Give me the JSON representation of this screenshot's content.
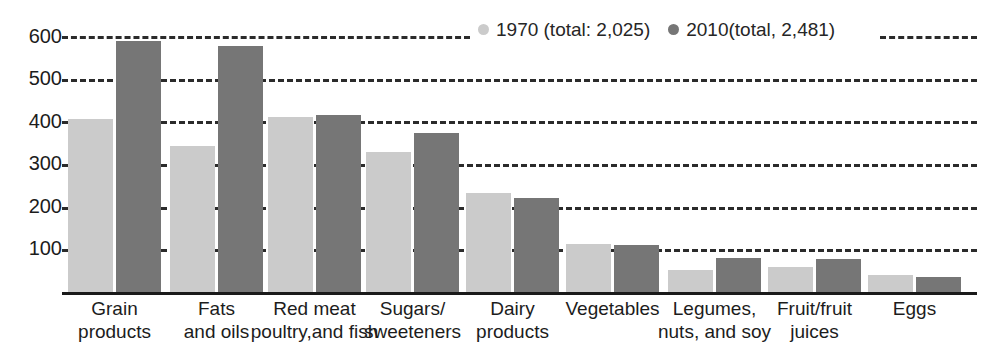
{
  "chart_data": {
    "type": "bar",
    "title": "",
    "subtitle": "",
    "xlabel": "",
    "ylabel": "",
    "ylim": [
      0,
      640
    ],
    "yticks": [
      100,
      200,
      300,
      400,
      500,
      600
    ],
    "ytick_labels": [
      "100",
      "200",
      "300",
      "400",
      "500",
      "600"
    ],
    "grid": true,
    "grid_style": "dashed-horizontal",
    "legend_position": "top-center",
    "categories": [
      "Grain products",
      "Fats and oils",
      "Red meat poultry,and fish",
      "Sugars/ sweeteners",
      "Dairy products",
      "Vegetables",
      "Legumes, nuts, and soy",
      "Fruit/fruit juices",
      "Eggs"
    ],
    "category_lines": [
      [
        "Grain",
        "products"
      ],
      [
        "Fats",
        "and oils"
      ],
      [
        "Red meat",
        "poultry,and fish"
      ],
      [
        "Sugars/",
        "sweeteners"
      ],
      [
        "Dairy",
        "products"
      ],
      [
        "Vegetables"
      ],
      [
        "Legumes,",
        "nuts, and soy"
      ],
      [
        "Fruit/fruit",
        "juices"
      ],
      [
        "Eggs"
      ]
    ],
    "series": [
      {
        "name": "1970 (total: 2,025)",
        "color": "#cbcbcb",
        "values": [
          408,
          345,
          412,
          330,
          235,
          115,
          55,
          60,
          42
        ]
      },
      {
        "name": "2010(total, 2,481)",
        "color": "#767676",
        "values": [
          590,
          578,
          418,
          375,
          222,
          113,
          82,
          80,
          37
        ]
      }
    ]
  },
  "legend": {
    "items": [
      {
        "label": "1970 (total: 2,025)",
        "color": "#cbcbcb"
      },
      {
        "label": "2010(total, 2,481)",
        "color": "#767676"
      }
    ]
  },
  "axes": {
    "y_tick_labels": [
      "600",
      "500",
      "400",
      "300",
      "200",
      "100"
    ]
  }
}
